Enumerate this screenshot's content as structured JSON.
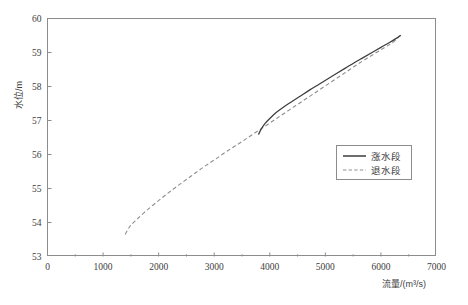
{
  "chart_data": {
    "type": "line",
    "title": "",
    "xlabel": "流量/(m³/s)",
    "ylabel": "水位/m",
    "xlim": [
      0,
      7000
    ],
    "ylim": [
      53,
      60
    ],
    "grid": false,
    "legend_position": "center-right",
    "x_ticks": [
      0,
      1000,
      2000,
      3000,
      4000,
      5000,
      6000,
      7000
    ],
    "x_tick_labels": [
      "0",
      "1000",
      "2000",
      "3000",
      "4000",
      "5000",
      "6000",
      "7000"
    ],
    "x_minor_ticks": [
      500,
      1500,
      2500,
      3500,
      4500,
      5500,
      6500
    ],
    "y_ticks": [
      53,
      54,
      55,
      56,
      57,
      58,
      59,
      60
    ],
    "y_tick_labels": [
      "53",
      "54",
      "55",
      "56",
      "57",
      "58",
      "59",
      "60"
    ],
    "series": [
      {
        "name": "涨水段",
        "style": "solid",
        "color": "#3d3d3d",
        "x": [
          3800,
          3850,
          3920,
          4000,
          4120,
          4250,
          4400,
          4560,
          4720,
          4880,
          5040,
          5200,
          5360,
          5520,
          5680,
          5840,
          6000,
          6140,
          6260,
          6350
        ],
        "y": [
          56.6,
          56.76,
          56.92,
          57.06,
          57.24,
          57.4,
          57.56,
          57.73,
          57.9,
          58.06,
          58.22,
          58.38,
          58.54,
          58.7,
          58.85,
          59.0,
          59.15,
          59.28,
          59.4,
          59.5
        ]
      },
      {
        "name": "退水段",
        "style": "dashed",
        "color": "#8f8f8f",
        "x": [
          1400,
          1480,
          1600,
          1760,
          1950,
          2150,
          2360,
          2580,
          2800,
          3020,
          3250,
          3480,
          3700,
          3920,
          4140,
          4360,
          4580,
          4800,
          5020,
          5240,
          5460,
          5680,
          5880,
          6060,
          6200,
          6300,
          6350
        ],
        "y": [
          53.65,
          53.88,
          54.08,
          54.32,
          54.58,
          54.84,
          55.1,
          55.36,
          55.62,
          55.86,
          56.12,
          56.36,
          56.6,
          56.84,
          57.08,
          57.32,
          57.56,
          57.8,
          58.04,
          58.28,
          58.52,
          58.76,
          58.96,
          59.14,
          59.28,
          59.42,
          59.5
        ]
      }
    ],
    "legend_entries": [
      {
        "label": "涨水段",
        "style": "solid"
      },
      {
        "label": "退水段",
        "style": "dashed"
      }
    ]
  },
  "plot": {
    "frame": {
      "left": 47,
      "top": 18,
      "right": 436,
      "bottom": 256
    },
    "legend": {
      "left": 336,
      "top": 145,
      "width": 76,
      "height": 35
    },
    "colors": {
      "frame": "#8c8c8c",
      "solid": "#3d3d3d",
      "dashed": "#8f8f8f",
      "text": "#404040"
    }
  }
}
